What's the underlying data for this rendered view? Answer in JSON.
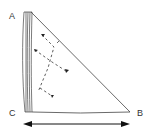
{
  "diagram": {
    "labels": {
      "a": "A",
      "b": "B",
      "c": "C"
    },
    "colors": {
      "stroke": "#333333",
      "background": "#ffffff"
    }
  }
}
